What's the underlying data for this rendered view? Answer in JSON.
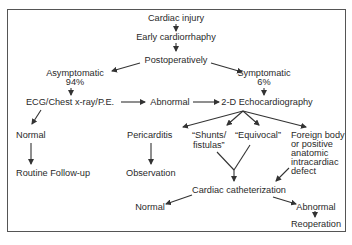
{
  "diagram": {
    "type": "flowchart",
    "colors": {
      "line": "#333333",
      "text": "#2a2a2a",
      "border": "#555555",
      "background": "#ffffff"
    },
    "nodes": {
      "cardiac_injury": "Cardiac injury",
      "early_cardiorrhaphy": "Early cardiorrhaphy",
      "postoperatively": "Postoperatively",
      "asymptomatic": "Asymptomatic",
      "asymptomatic_pct": "94%",
      "symptomatic": "Symptomatic",
      "symptomatic_pct": "6%",
      "ecg_xray_pe": "ECG/Chest x-ray/P.E.",
      "abnormal_1": "Abnormal",
      "echo_2d": "2-D Echocardiography",
      "normal_1": "Normal",
      "routine_followup": "Routine Follow-up",
      "pericarditis": "Pericarditis",
      "observation": "Observation",
      "shunts_line1": "“Shunts/",
      "shunts_line2": "fistulas”",
      "equivocal": "“Equivocal”",
      "foreign_line1": "Foreign body",
      "foreign_line2": "or positive",
      "foreign_line3": "anatomic",
      "foreign_line4": "intracardiac",
      "foreign_line5": "defect",
      "cardiac_cath": "Cardiac catheterization",
      "normal_2": "Normal",
      "abnormal_2": "Abnormal",
      "reoperation": "Reoperation"
    },
    "edges": [
      [
        "Cardiac injury",
        "Early cardiorrhaphy"
      ],
      [
        "Early cardiorrhaphy",
        "Postoperatively"
      ],
      [
        "Postoperatively",
        "Asymptomatic 94%"
      ],
      [
        "Postoperatively",
        "Symptomatic 6%"
      ],
      [
        "Asymptomatic 94%",
        "ECG/Chest x-ray/P.E."
      ],
      [
        "Symptomatic 6%",
        "2-D Echocardiography"
      ],
      [
        "ECG/Chest x-ray/P.E.",
        "Abnormal"
      ],
      [
        "Abnormal",
        "2-D Echocardiography"
      ],
      [
        "ECG/Chest x-ray/P.E.",
        "Normal"
      ],
      [
        "Normal",
        "Routine Follow-up"
      ],
      [
        "2-D Echocardiography",
        "Pericarditis"
      ],
      [
        "2-D Echocardiography",
        "Shunts/fistulas"
      ],
      [
        "2-D Echocardiography",
        "Equivocal"
      ],
      [
        "2-D Echocardiography",
        "Foreign body or positive anatomic intracardiac defect"
      ],
      [
        "Pericarditis",
        "Observation"
      ],
      [
        "Shunts/fistulas",
        "Cardiac catheterization"
      ],
      [
        "Equivocal",
        "Cardiac catheterization"
      ],
      [
        "Foreign body or positive anatomic intracardiac defect",
        "Cardiac catheterization"
      ],
      [
        "Cardiac catheterization",
        "Normal"
      ],
      [
        "Cardiac catheterization",
        "Abnormal"
      ],
      [
        "Abnormal",
        "Reoperation"
      ]
    ]
  }
}
